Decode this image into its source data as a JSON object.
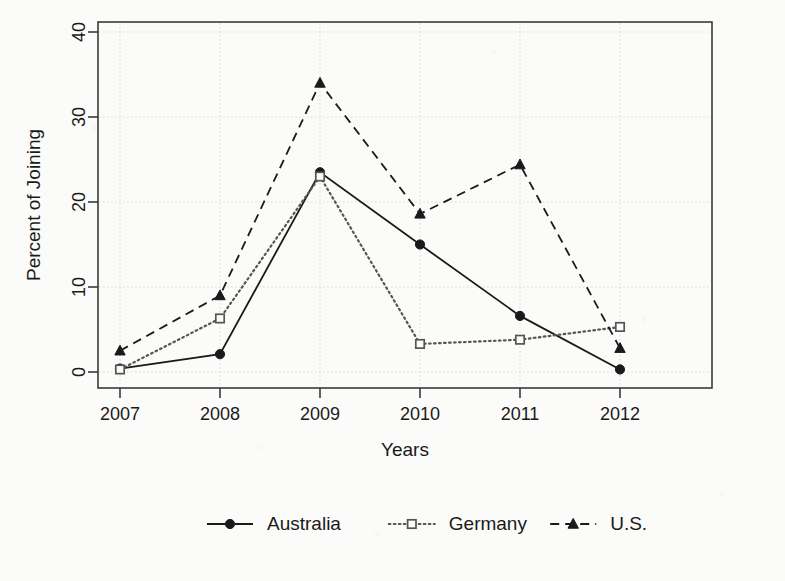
{
  "chart_data": {
    "type": "line",
    "title": "",
    "xlabel": "Years",
    "ylabel": "Percent of Joining",
    "categories": [
      "2007",
      "2008",
      "2009",
      "2010",
      "2011",
      "2012"
    ],
    "x": [
      2007,
      2008,
      2009,
      2010,
      2011,
      2012
    ],
    "xlim": [
      2006.6,
      2012.4
    ],
    "ylim": [
      0,
      42
    ],
    "yticks": [
      0,
      10,
      20,
      30,
      40
    ],
    "ytick_labels": [
      "0",
      "10",
      "20",
      "30",
      "40"
    ],
    "xtick_labels": [
      "2007",
      "2008",
      "2009",
      "2010",
      "2011",
      "2012"
    ],
    "grid": true,
    "grid_style": "dotted",
    "legend_position": "bottom",
    "series": [
      {
        "name": "Australia",
        "values": [
          0.4,
          2.1,
          23.5,
          15.0,
          6.6,
          0.3
        ],
        "line_style": "solid",
        "marker": "filled-circle",
        "color": "#1a1a1a"
      },
      {
        "name": "Germany",
        "values": [
          0.3,
          6.3,
          23.0,
          3.3,
          3.8,
          5.3
        ],
        "line_style": "dotted",
        "marker": "open-square",
        "color": "#555555"
      },
      {
        "name": "U.S.",
        "values": [
          2.5,
          9.0,
          34.0,
          18.6,
          24.4,
          2.8
        ],
        "line_style": "dashed",
        "marker": "filled-triangle",
        "color": "#1a1a1a"
      }
    ]
  },
  "legend": {
    "items": [
      {
        "label": "Australia",
        "key": "australia"
      },
      {
        "label": "Germany",
        "key": "germany"
      },
      {
        "label": "U.S.",
        "key": "us"
      }
    ]
  },
  "colors": {
    "ink": "#1a1a1a",
    "axis": "#3a3a3a",
    "grid": "#d8d8d8",
    "background": "#fbfbf9"
  }
}
